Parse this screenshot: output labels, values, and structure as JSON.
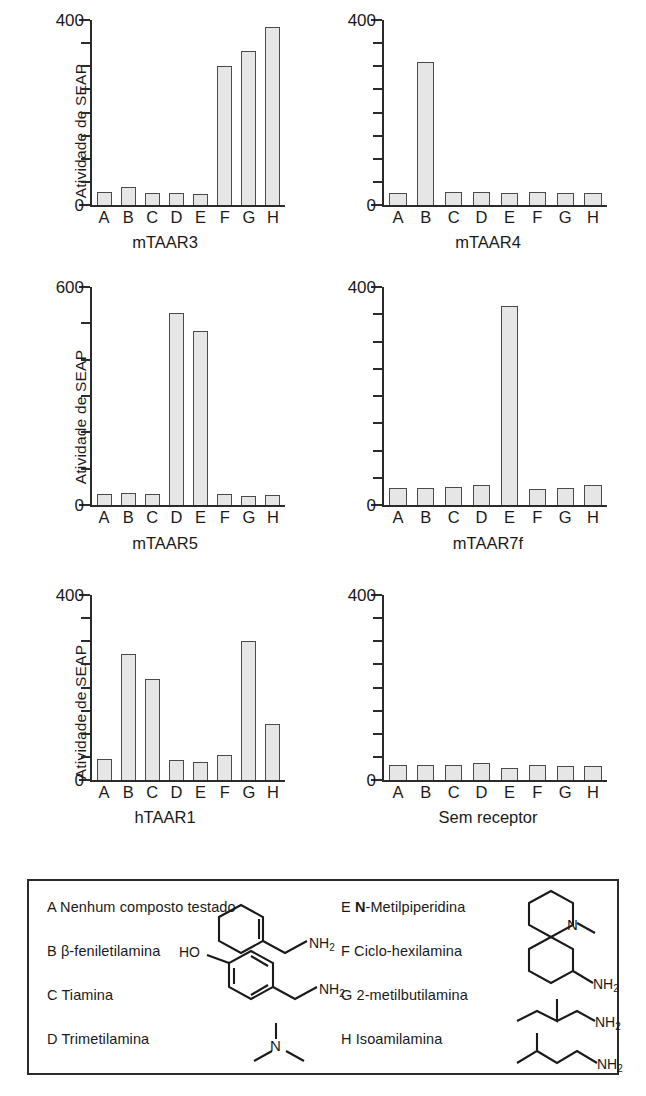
{
  "axis_title": "Atividade de SEAP",
  "categories": [
    "A",
    "B",
    "C",
    "D",
    "E",
    "F",
    "G",
    "H"
  ],
  "colors": {
    "bar_fill": "#e6e6e6",
    "bar_stroke": "#4a4a4a",
    "axis": "#2b2b2b",
    "text": "#1a1a1a"
  },
  "panels": [
    {
      "title": "mTAAR3",
      "ymax": 400,
      "ytop_label": "400",
      "yzero_label": "0"
    },
    {
      "title": "mTAAR4",
      "ymax": 400,
      "ytop_label": "400",
      "yzero_label": "0"
    },
    {
      "title": "mTAAR5",
      "ymax": 600,
      "ytop_label": "600",
      "yzero_label": "0"
    },
    {
      "title": "mTAAR7f",
      "ymax": 400,
      "ytop_label": "400",
      "yzero_label": "0"
    },
    {
      "title": "hTAAR1",
      "ymax": 400,
      "ytop_label": "400",
      "yzero_label": "0"
    },
    {
      "title": "Sem receptor",
      "ymax": 400,
      "ytop_label": "400",
      "yzero_label": "0"
    }
  ],
  "legend": {
    "left": [
      {
        "key": "A",
        "name": "Nenhum composto testado",
        "bold_prefix": ""
      },
      {
        "key": "B",
        "name": "β-feniletilamina",
        "bold_prefix": ""
      },
      {
        "key": "C",
        "name": "Tiamina",
        "bold_prefix": ""
      },
      {
        "key": "D",
        "name": "Trimetilamina",
        "bold_prefix": ""
      }
    ],
    "right": [
      {
        "key": "E",
        "name": "-Metilpiperidina",
        "bold_prefix": "N"
      },
      {
        "key": "F",
        "name": "Ciclo-hexilamina",
        "bold_prefix": ""
      },
      {
        "key": "G",
        "name": "2-metilbutilamina",
        "bold_prefix": ""
      },
      {
        "key": "H",
        "name": "Isoamilamina",
        "bold_prefix": ""
      }
    ],
    "structure_labels": {
      "nh2": "NH",
      "nh2_sub": "2",
      "ho": "HO",
      "n": "N"
    }
  },
  "chart_data": [
    {
      "type": "bar",
      "title": "mTAAR3",
      "xlabel": "mTAAR3",
      "ylabel": "Atividade de SEAP",
      "ylim": [
        0,
        400
      ],
      "yticks": [
        0,
        50,
        100,
        150,
        200,
        250,
        300,
        350,
        400
      ],
      "ytick_labels": [
        "0",
        "",
        "",
        "",
        "",
        "",
        "",
        "",
        "400"
      ],
      "grid": false,
      "legend": "none",
      "categories": [
        "A",
        "B",
        "C",
        "D",
        "E",
        "F",
        "G",
        "H"
      ],
      "values": [
        28,
        38,
        27,
        25,
        24,
        300,
        333,
        385
      ]
    },
    {
      "type": "bar",
      "title": "mTAAR4",
      "xlabel": "mTAAR4",
      "ylabel": "",
      "ylim": [
        0,
        400
      ],
      "yticks": [
        0,
        50,
        100,
        150,
        200,
        250,
        300,
        350,
        400
      ],
      "ytick_labels": [
        "0",
        "",
        "",
        "",
        "",
        "",
        "",
        "",
        "400"
      ],
      "grid": false,
      "legend": "none",
      "categories": [
        "A",
        "B",
        "C",
        "D",
        "E",
        "F",
        "G",
        "H"
      ],
      "values": [
        26,
        310,
        28,
        28,
        27,
        28,
        27,
        27
      ]
    },
    {
      "type": "bar",
      "title": "mTAAR5",
      "xlabel": "mTAAR5",
      "ylabel": "Atividade de SEAP",
      "ylim": [
        0,
        600
      ],
      "yticks": [
        0,
        100,
        200,
        300,
        400,
        500,
        600
      ],
      "ytick_labels": [
        "0",
        "",
        "",
        "",
        "",
        "",
        "600"
      ],
      "grid": false,
      "legend": "none",
      "categories": [
        "A",
        "B",
        "C",
        "D",
        "E",
        "F",
        "G",
        "H"
      ],
      "values": [
        30,
        32,
        31,
        528,
        480,
        30,
        26,
        28
      ]
    },
    {
      "type": "bar",
      "title": "mTAAR7f",
      "xlabel": "mTAAR7f",
      "ylabel": "",
      "ylim": [
        0,
        400
      ],
      "yticks": [
        0,
        50,
        100,
        150,
        200,
        250,
        300,
        350,
        400
      ],
      "ytick_labels": [
        "0",
        "",
        "",
        "",
        "",
        "",
        "",
        "",
        "400"
      ],
      "grid": false,
      "legend": "none",
      "categories": [
        "A",
        "B",
        "C",
        "D",
        "E",
        "F",
        "G",
        "H"
      ],
      "values": [
        32,
        31,
        33,
        36,
        366,
        29,
        32,
        36
      ]
    },
    {
      "type": "bar",
      "title": "hTAAR1",
      "xlabel": "hTAAR1",
      "ylabel": "Atividade de SEAP",
      "ylim": [
        0,
        400
      ],
      "yticks": [
        0,
        50,
        100,
        150,
        200,
        250,
        300,
        350,
        400
      ],
      "ytick_labels": [
        "0",
        "",
        "",
        "",
        "",
        "",
        "",
        "",
        "400"
      ],
      "grid": false,
      "legend": "none",
      "categories": [
        "A",
        "B",
        "C",
        "D",
        "E",
        "F",
        "G",
        "H"
      ],
      "values": [
        45,
        272,
        219,
        44,
        38,
        55,
        300,
        122
      ]
    },
    {
      "type": "bar",
      "title": "Sem receptor",
      "xlabel": "Sem receptor",
      "ylabel": "",
      "ylim": [
        0,
        400
      ],
      "yticks": [
        0,
        50,
        100,
        150,
        200,
        250,
        300,
        350,
        400
      ],
      "ytick_labels": [
        "0",
        "",
        "",
        "",
        "",
        "",
        "",
        "",
        "400"
      ],
      "grid": false,
      "legend": "none",
      "categories": [
        "A",
        "B",
        "C",
        "D",
        "E",
        "F",
        "G",
        "H"
      ],
      "values": [
        33,
        33,
        32,
        37,
        27,
        32,
        30,
        30
      ]
    }
  ]
}
